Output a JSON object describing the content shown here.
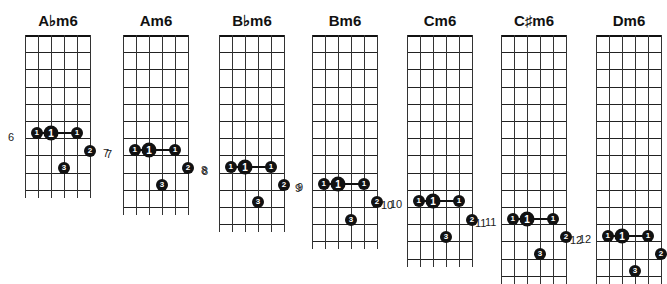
{
  "chords": [
    {
      "name": "A♭m6",
      "left": 25,
      "frets": 9,
      "bar_row": 6,
      "left_label": "6",
      "right_label": "7"
    },
    {
      "name": "Am6",
      "left": 123,
      "frets": 10,
      "bar_row": 7,
      "left_label": "7",
      "right_label": "8"
    },
    {
      "name": "B♭m6",
      "left": 219,
      "frets": 11,
      "bar_row": 8,
      "left_label": "8",
      "right_label": "9"
    },
    {
      "name": "Bm6",
      "left": 312,
      "frets": 12,
      "bar_row": 9,
      "left_label": "9",
      "right_label": "10"
    },
    {
      "name": "Cm6",
      "left": 407,
      "frets": 13,
      "bar_row": 10,
      "left_label": "10",
      "right_label": "11"
    },
    {
      "name": "C♯m6",
      "left": 501,
      "frets": 14,
      "bar_row": 11,
      "left_label": "11",
      "right_label": "12"
    },
    {
      "name": "Dm6",
      "left": 596,
      "frets": 14,
      "bar_row": 12,
      "left_label": "12",
      "right_label": ""
    }
  ],
  "fingers": {
    "one": "1",
    "two": "2",
    "three": "3"
  }
}
